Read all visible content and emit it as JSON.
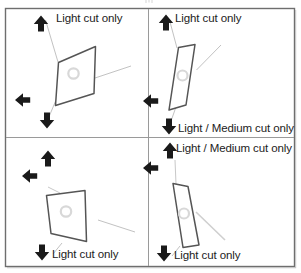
{
  "figure": {
    "title": "",
    "frame": {
      "border_color": "#6e6e6e",
      "divider_color": "#9a9a9a"
    },
    "colors": {
      "arrow": "#1a1a1a",
      "shape_outline": "#555555",
      "shape_fill": "#ffffff",
      "thin_line": "#b9b9b9",
      "circle": "#d8d8d8",
      "text": "#222222"
    },
    "quadrants": [
      {
        "id": "top-left",
        "labels": [
          {
            "text": "Light cut only",
            "position": "top"
          }
        ],
        "arrows": [
          {
            "direction": "up"
          },
          {
            "direction": "left"
          },
          {
            "direction": "down"
          }
        ],
        "shape": "parallelogram-wide"
      },
      {
        "id": "top-right",
        "labels": [
          {
            "text": "Light cut only",
            "position": "top"
          },
          {
            "text": "Light / Medium cut only",
            "position": "bottom"
          }
        ],
        "arrows": [
          {
            "direction": "up"
          },
          {
            "direction": "left"
          },
          {
            "direction": "down"
          }
        ],
        "shape": "parallelogram-narrow"
      },
      {
        "id": "bottom-left",
        "labels": [
          {
            "text": "Light cut only",
            "position": "bottom"
          }
        ],
        "arrows": [
          {
            "direction": "up"
          },
          {
            "direction": "left"
          },
          {
            "direction": "down"
          }
        ],
        "shape": "parallelogram-wide"
      },
      {
        "id": "bottom-right",
        "labels": [
          {
            "text": "Light / Medium cut only",
            "position": "top"
          },
          {
            "text": "Light cut only",
            "position": "bottom"
          }
        ],
        "arrows": [
          {
            "direction": "up"
          },
          {
            "direction": "left"
          },
          {
            "direction": "down"
          }
        ],
        "shape": "parallelogram-narrow"
      }
    ]
  },
  "labels": {
    "q1_top": "Light cut only",
    "q2_top": "Light cut only",
    "q2_bottom": "Light / Medium cut only",
    "q3_bottom": "Light cut only",
    "q4_top": "Light / Medium cut only",
    "q4_bottom": "Light cut only"
  }
}
